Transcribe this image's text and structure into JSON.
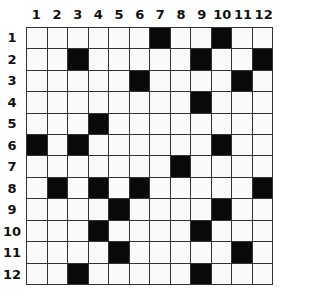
{
  "puzzle": {
    "type": "crossword-grid",
    "rows": 12,
    "cols": 12,
    "column_labels": [
      "1",
      "2",
      "3",
      "4",
      "5",
      "6",
      "7",
      "8",
      "9",
      "10",
      "11",
      "12"
    ],
    "row_labels": [
      "1",
      "2",
      "3",
      "4",
      "5",
      "6",
      "7",
      "8",
      "9",
      "10",
      "11",
      "12"
    ],
    "black_cells": {
      "1": [
        7,
        10
      ],
      "2": [
        3,
        9,
        12
      ],
      "3": [
        6,
        11
      ],
      "4": [
        9
      ],
      "5": [
        4
      ],
      "6": [
        1,
        3,
        10
      ],
      "7": [
        8
      ],
      "8": [
        2,
        4,
        6,
        12
      ],
      "9": [
        5,
        10
      ],
      "10": [
        4,
        9
      ],
      "11": [
        5,
        11
      ],
      "12": [
        3,
        9
      ]
    },
    "colors": {
      "black": "#0a0a0a",
      "white": "#fafafa",
      "line": "#333333"
    }
  }
}
